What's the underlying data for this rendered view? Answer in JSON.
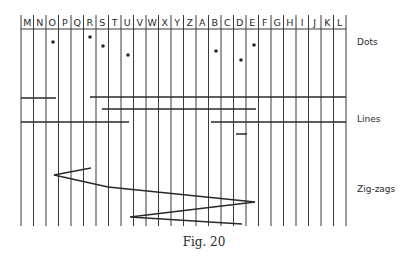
{
  "figure": {
    "caption": "Fig. 20",
    "grid": {
      "left": 21,
      "right": 346,
      "top": 15,
      "header_bottom": 29,
      "bottom": 226,
      "columns": [
        "M",
        "N",
        "O",
        "P",
        "Q",
        "R",
        "S",
        "T",
        "U",
        "V",
        "W",
        "X",
        "Y",
        "Z",
        "A",
        "B",
        "C",
        "D",
        "E",
        "F",
        "G",
        "H",
        "I",
        "J",
        "K",
        "L"
      ]
    },
    "sections": {
      "dots": {
        "label": "Dots",
        "label_y": 43,
        "points": [
          {
            "x": 53,
            "y": 42,
            "column": "O"
          },
          {
            "x": 90,
            "y": 37,
            "column": "R"
          },
          {
            "x": 103,
            "y": 46,
            "column": "S"
          },
          {
            "x": 128,
            "y": 55,
            "column": "U"
          },
          {
            "x": 216,
            "y": 51,
            "column": "B"
          },
          {
            "x": 241,
            "y": 60,
            "column": "D"
          },
          {
            "x": 254,
            "y": 45,
            "column": "E"
          }
        ]
      },
      "lines": {
        "label": "Lines",
        "label_y": 120,
        "segments": [
          {
            "x1": 21,
            "x2": 56,
            "y": 98
          },
          {
            "x1": 90,
            "x2": 346,
            "y": 97
          },
          {
            "x1": 102,
            "x2": 256,
            "y": 109
          },
          {
            "x1": 21,
            "x2": 129,
            "y": 122
          },
          {
            "x1": 211,
            "x2": 346,
            "y": 122
          },
          {
            "x1": 236,
            "x2": 247,
            "y": 134
          }
        ]
      },
      "zigzags": {
        "label": "Zig-zags",
        "label_y": 190,
        "points": [
          [
            91,
            168
          ],
          [
            54,
            175
          ],
          [
            108,
            187
          ],
          [
            255,
            202
          ],
          [
            130,
            217
          ],
          [
            242,
            224
          ]
        ]
      }
    },
    "colors": {
      "ink": "#2a2a2a",
      "grid": "#3a3a3a",
      "background": "#ffffff"
    }
  }
}
